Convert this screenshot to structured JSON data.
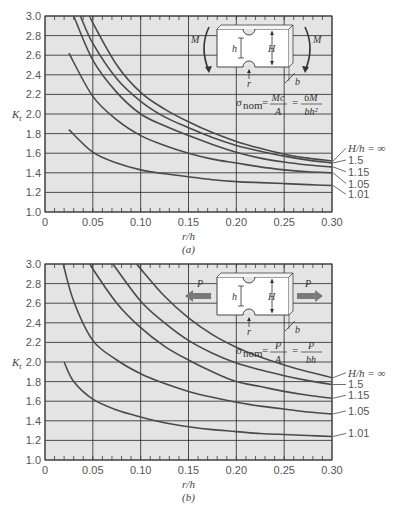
{
  "chart_data": [
    {
      "type": "line",
      "panel_label": "(a)",
      "title": "Stress concentration factor Kt — notched flat bar in bending",
      "xlabel": "r/h",
      "ylabel": "Kt",
      "xlim": [
        0,
        0.3
      ],
      "ylim": [
        1.0,
        3.0
      ],
      "x_ticks": [
        "0",
        "0.05",
        "0.10",
        "0.15",
        "0.20",
        "0.25",
        "0.30"
      ],
      "y_ticks": [
        "1.0",
        "1.2",
        "1.4",
        "1.6",
        "1.8",
        "2.0",
        "2.2",
        "2.4",
        "2.6",
        "2.8",
        "3.0"
      ],
      "grid": true,
      "legend_title": "H/h = ∞",
      "legend_position": "right",
      "formula": {
        "lhs": "σ",
        "sub": "nom",
        "eq1_num": "Mc",
        "eq1_den": "A",
        "eq2_num": "6M",
        "eq2_den": "bh²"
      },
      "diagram_labels": {
        "load_left": "M",
        "load_right": "M",
        "h": "h",
        "H": "H",
        "r": "r",
        "b": "b"
      },
      "series": [
        {
          "name": "H/h = ∞",
          "label": "H/h = ∞",
          "points": [
            [
              0.047,
              3.0
            ],
            [
              0.05,
              2.93
            ],
            [
              0.075,
              2.5
            ],
            [
              0.1,
              2.22
            ],
            [
              0.125,
              2.05
            ],
            [
              0.15,
              1.92
            ],
            [
              0.175,
              1.81
            ],
            [
              0.2,
              1.72
            ],
            [
              0.225,
              1.65
            ],
            [
              0.25,
              1.59
            ],
            [
              0.275,
              1.55
            ],
            [
              0.3,
              1.52
            ]
          ]
        },
        {
          "name": "1.5",
          "label": "1.5",
          "points": [
            [
              0.037,
              3.0
            ],
            [
              0.05,
              2.72
            ],
            [
              0.075,
              2.36
            ],
            [
              0.1,
              2.13
            ],
            [
              0.125,
              1.97
            ],
            [
              0.15,
              1.86
            ],
            [
              0.175,
              1.76
            ],
            [
              0.2,
              1.68
            ],
            [
              0.225,
              1.62
            ],
            [
              0.25,
              1.57
            ],
            [
              0.275,
              1.53
            ],
            [
              0.3,
              1.5
            ]
          ]
        },
        {
          "name": "1.15",
          "label": "1.15",
          "points": [
            [
              0.03,
              3.0
            ],
            [
              0.05,
              2.55
            ],
            [
              0.075,
              2.22
            ],
            [
              0.1,
              2.0
            ],
            [
              0.125,
              1.88
            ],
            [
              0.15,
              1.78
            ],
            [
              0.175,
              1.69
            ],
            [
              0.2,
              1.61
            ],
            [
              0.225,
              1.55
            ],
            [
              0.25,
              1.51
            ],
            [
              0.275,
              1.48
            ],
            [
              0.3,
              1.46
            ]
          ]
        },
        {
          "name": "1.05",
          "label": "1.05",
          "points": [
            [
              0.025,
              2.62
            ],
            [
              0.05,
              2.18
            ],
            [
              0.075,
              1.94
            ],
            [
              0.1,
              1.78
            ],
            [
              0.125,
              1.68
            ],
            [
              0.15,
              1.6
            ],
            [
              0.175,
              1.54
            ],
            [
              0.2,
              1.5
            ],
            [
              0.225,
              1.46
            ],
            [
              0.25,
              1.43
            ],
            [
              0.275,
              1.41
            ],
            [
              0.3,
              1.4
            ]
          ]
        },
        {
          "name": "1.01",
          "label": "1.01",
          "points": [
            [
              0.025,
              1.84
            ],
            [
              0.05,
              1.61
            ],
            [
              0.075,
              1.5
            ],
            [
              0.1,
              1.43
            ],
            [
              0.125,
              1.39
            ],
            [
              0.15,
              1.36
            ],
            [
              0.175,
              1.33
            ],
            [
              0.2,
              1.31
            ],
            [
              0.225,
              1.3
            ],
            [
              0.25,
              1.29
            ],
            [
              0.275,
              1.28
            ],
            [
              0.3,
              1.27
            ]
          ]
        }
      ]
    },
    {
      "type": "line",
      "panel_label": "(b)",
      "title": "Stress concentration factor Kt — notched flat bar in axial tension",
      "xlabel": "r/h",
      "ylabel": "Kt",
      "xlim": [
        0,
        0.3
      ],
      "ylim": [
        1.0,
        3.0
      ],
      "x_ticks": [
        "0",
        "0.05",
        "0.10",
        "0.15",
        "0.20",
        "0.25",
        "0.30"
      ],
      "y_ticks": [
        "1.0",
        "1.2",
        "1.4",
        "1.6",
        "1.8",
        "2.0",
        "2.2",
        "2.4",
        "2.6",
        "2.8",
        "3.0"
      ],
      "grid": true,
      "legend_title": "H/h = ∞",
      "legend_position": "right",
      "formula": {
        "lhs": "σ",
        "sub": "nom",
        "eq1_num": "P",
        "eq1_den": "A",
        "eq2_num": "P",
        "eq2_den": "bh"
      },
      "diagram_labels": {
        "load_left": "P",
        "load_right": "P",
        "h": "h",
        "H": "H",
        "r": "r",
        "b": "b"
      },
      "series": [
        {
          "name": "H/h = ∞",
          "label": "H/h = ∞",
          "points": [
            [
              0.096,
              3.0
            ],
            [
              0.1,
              2.95
            ],
            [
              0.125,
              2.67
            ],
            [
              0.15,
              2.45
            ],
            [
              0.175,
              2.28
            ],
            [
              0.2,
              2.15
            ],
            [
              0.225,
              2.05
            ],
            [
              0.25,
              1.97
            ],
            [
              0.275,
              1.9
            ],
            [
              0.3,
              1.84
            ]
          ]
        },
        {
          "name": "1.5",
          "label": "1.5",
          "points": [
            [
              0.071,
              3.0
            ],
            [
              0.1,
              2.62
            ],
            [
              0.125,
              2.4
            ],
            [
              0.15,
              2.22
            ],
            [
              0.175,
              2.09
            ],
            [
              0.2,
              1.99
            ],
            [
              0.225,
              1.92
            ],
            [
              0.25,
              1.86
            ],
            [
              0.275,
              1.81
            ],
            [
              0.3,
              1.77
            ]
          ]
        },
        {
          "name": "1.15",
          "label": "1.15",
          "points": [
            [
              0.048,
              3.0
            ],
            [
              0.05,
              2.95
            ],
            [
              0.075,
              2.6
            ],
            [
              0.1,
              2.35
            ],
            [
              0.125,
              2.16
            ],
            [
              0.15,
              2.02
            ],
            [
              0.175,
              1.9
            ],
            [
              0.2,
              1.8
            ],
            [
              0.225,
              1.75
            ],
            [
              0.25,
              1.7
            ],
            [
              0.275,
              1.66
            ],
            [
              0.3,
              1.63
            ]
          ]
        },
        {
          "name": "1.05",
          "label": "1.05",
          "points": [
            [
              0.019,
              3.0
            ],
            [
              0.03,
              2.62
            ],
            [
              0.05,
              2.22
            ],
            [
              0.075,
              2.02
            ],
            [
              0.1,
              1.88
            ],
            [
              0.125,
              1.78
            ],
            [
              0.15,
              1.7
            ],
            [
              0.175,
              1.64
            ],
            [
              0.2,
              1.59
            ],
            [
              0.225,
              1.55
            ],
            [
              0.25,
              1.52
            ],
            [
              0.275,
              1.49
            ],
            [
              0.3,
              1.47
            ]
          ]
        },
        {
          "name": "1.01",
          "label": "1.01",
          "points": [
            [
              0.02,
              2.0
            ],
            [
              0.03,
              1.8
            ],
            [
              0.05,
              1.62
            ],
            [
              0.075,
              1.51
            ],
            [
              0.1,
              1.44
            ],
            [
              0.125,
              1.38
            ],
            [
              0.15,
              1.34
            ],
            [
              0.175,
              1.31
            ],
            [
              0.2,
              1.29
            ],
            [
              0.225,
              1.27
            ],
            [
              0.25,
              1.26
            ],
            [
              0.275,
              1.25
            ],
            [
              0.3,
              1.24
            ]
          ]
        }
      ]
    }
  ],
  "colors": {
    "plot_background": "#e4e4e4",
    "grid_major": "#3a3a3a",
    "curve": "#4a4a4a",
    "text": "#555555",
    "arrow": "#7a7a7a",
    "specimen_fill": "#ffffff"
  }
}
